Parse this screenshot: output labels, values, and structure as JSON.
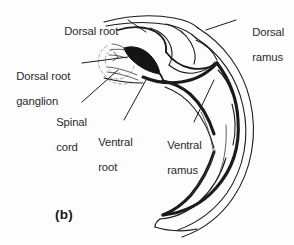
{
  "figure": {
    "caption": "(b)",
    "background_color": "#fdfdfd",
    "line_color": "#1b1b1b",
    "ganglion_fill_color": "#141414",
    "label_color": "#2a2a2a"
  },
  "labels": {
    "dorsal_root": "Dorsal root",
    "dorsal_root_ganglion_line1": "Dorsal root",
    "dorsal_root_ganglion_line2": "ganglion",
    "spinal_cord_line1": "Spinal",
    "spinal_cord_line2": "cord",
    "ventral_root_line1": "Ventral",
    "ventral_root_line2": "root",
    "ventral_ramus_line1": "Ventral",
    "ventral_ramus_line2": "ramus",
    "dorsal_ramus_line1": "Dorsal",
    "dorsal_ramus_line2": "ramus"
  }
}
